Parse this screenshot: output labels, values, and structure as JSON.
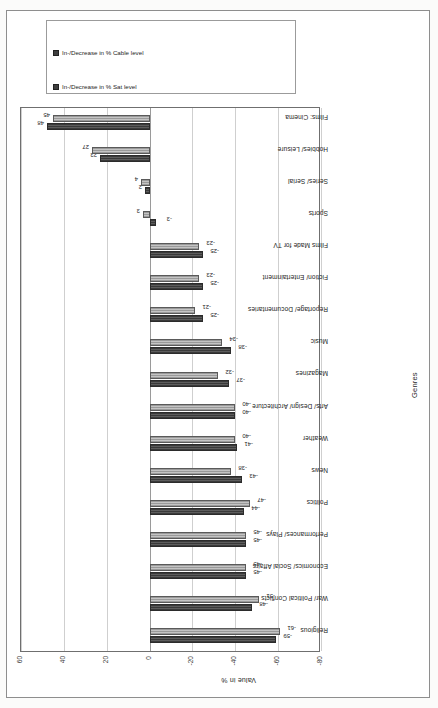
{
  "axis": {
    "y_title": "Value in %",
    "x_title": "Genres",
    "y_ticks": [
      "60",
      "40",
      "20",
      "0",
      "-20",
      "-40",
      "-60",
      "-80"
    ]
  },
  "legend": {
    "items": [
      {
        "label": "In-/Decrease in % Sat level",
        "color": "#3f3f3f"
      },
      {
        "label": "In-/Decrease in % Cable level",
        "color": "#3f3f3f"
      }
    ]
  },
  "chart_data": {
    "type": "bar",
    "title": "",
    "xlabel": "Genres",
    "ylabel": "Value in %",
    "ylim": [
      -80,
      60
    ],
    "yticks": [
      60,
      40,
      20,
      0,
      -20,
      -40,
      -60,
      -80
    ],
    "grid": true,
    "legend_position": "right",
    "categories": [
      "Religious",
      "War/ Political Conflicts",
      "Economics/ Social Affairs",
      "Performances/ Plays",
      "Politics",
      "News",
      "Weather",
      "Arts/ Design/ Architecture",
      "Magazines",
      "Music",
      "Reportage/ Documentaries",
      "Fiction/ Entertainment",
      "Films Made for TV",
      "Sports",
      "Series/ Serial",
      "Hobbies/ Leisure",
      "Films: Cinema"
    ],
    "series": [
      {
        "name": "In-/Decrease in % Sat level",
        "values": [
          -59,
          -48,
          -45,
          -45,
          -44,
          -43,
          -41,
          -40,
          -37,
          -38,
          -25,
          -25,
          -25,
          -3,
          2,
          23,
          48
        ]
      },
      {
        "name": "In-/Decrease in % Cable level",
        "values": [
          -61,
          -51,
          -45,
          -45,
          -47,
          -38,
          -40,
          -40,
          -32,
          -34,
          -21,
          -23,
          -23,
          3,
          4,
          27,
          45
        ]
      }
    ],
    "data_labels": {
      "series1": [
        "-59",
        "-48",
        "-45",
        "-45",
        "-44",
        "-43",
        "-41",
        "-40",
        "-37",
        "-38",
        "-25",
        "-25",
        "-25",
        "-3",
        "2",
        "23",
        "48"
      ],
      "series2": [
        "-61",
        "-51",
        "-45",
        "-45",
        "-47",
        "-38",
        "-40",
        "-40",
        "-32",
        "-34",
        "-21",
        "-23",
        "-23",
        "3",
        "4",
        "27",
        "45"
      ]
    }
  }
}
